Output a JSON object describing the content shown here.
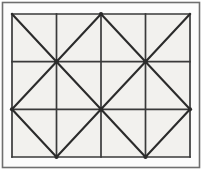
{
  "figure": {
    "canvas": {
      "width": 203,
      "height": 171
    },
    "colors": {
      "page_background": "#ffffff",
      "margin_background": "#fcfcfc",
      "grid_background": "#f2f1ee",
      "outer_frame_stroke": "#6f6f6f",
      "grid_stroke": "#3a3a3a",
      "diagonal_stroke": "#2b2b2b"
    },
    "outer_frame": {
      "x": 2.5,
      "y": 2.5,
      "width": 197,
      "height": 165,
      "stroke_width": 1.6
    },
    "grid": {
      "x": 12,
      "y": 14,
      "width": 178,
      "height": 143,
      "columns": 4,
      "rows": 3,
      "stroke_width": 1.7,
      "x_lines": [
        12,
        56.5,
        101,
        145.5,
        190
      ],
      "y_lines": [
        14,
        61.7,
        109.3,
        157
      ]
    },
    "diagonals": {
      "stroke_width": 2.1,
      "note": "one diagonal per cell, alternating direction to form diamonds",
      "pattern": [
        [
          "backslash",
          "slash",
          "backslash",
          "slash"
        ],
        [
          "slash",
          "backslash",
          "slash",
          "backslash"
        ],
        [
          "backslash",
          "slash",
          "backslash",
          "slash"
        ]
      ]
    }
  }
}
